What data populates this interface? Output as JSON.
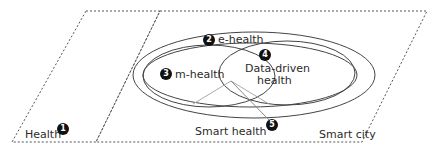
{
  "diagram": {
    "regions": [
      {
        "id": "health",
        "label": "Health",
        "badge": "1"
      },
      {
        "id": "e-health",
        "label": "e-health",
        "badge": "2"
      },
      {
        "id": "m-health",
        "label": "m-health",
        "badge": "3"
      },
      {
        "id": "data-driven-health",
        "label_line1": "Data-driven",
        "label_line2": "health",
        "badge": "4"
      },
      {
        "id": "smart-health",
        "label": "Smart health",
        "badge": "5"
      },
      {
        "id": "smart-city",
        "label": "Smart city"
      }
    ],
    "colors": {
      "line": "#444444",
      "dashed": "#555555",
      "pointer": "#aaaaaa",
      "badge": "#111111"
    }
  }
}
